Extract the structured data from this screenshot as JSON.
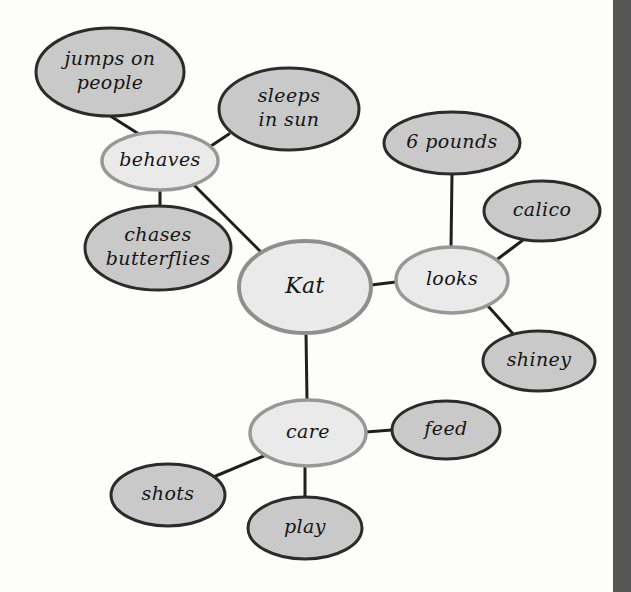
{
  "document": {
    "type": "concept-map",
    "title": "Kat",
    "background_color": "#fdfdfc",
    "right_strip_color": "#565656"
  },
  "style": {
    "primary_node_fill": "#eaeaea",
    "primary_node_stroke": "#8f8f8f",
    "leaf_node_fill": "#c9c9c9",
    "leaf_node_stroke": "#2b2b2b",
    "edge_color": "#1f1f1f",
    "text_color": "#151515"
  },
  "nodes": [
    {
      "id": "kat",
      "label": "Kat",
      "lines": [
        "Kat"
      ],
      "level": "root",
      "cx": 305,
      "cy": 287,
      "rx": 66,
      "ry": 46,
      "fill": "#eaeaea",
      "stroke": "#8f8f8f",
      "stroke_width": 4,
      "font_size": 22
    },
    {
      "id": "behaves",
      "label": "behaves",
      "lines": [
        "behaves"
      ],
      "level": "branch",
      "cx": 160,
      "cy": 161,
      "rx": 58,
      "ry": 29,
      "fill": "#eaeaea",
      "stroke": "#989898",
      "stroke_width": 3.5,
      "font_size": 19
    },
    {
      "id": "looks",
      "label": "looks",
      "lines": [
        "looks"
      ],
      "level": "branch",
      "cx": 452,
      "cy": 280,
      "rx": 56,
      "ry": 33,
      "fill": "#eaeaea",
      "stroke": "#989898",
      "stroke_width": 3.5,
      "font_size": 19
    },
    {
      "id": "care",
      "label": "care",
      "lines": [
        "care"
      ],
      "level": "branch",
      "cx": 308,
      "cy": 433,
      "rx": 58,
      "ry": 33,
      "fill": "#eaeaea",
      "stroke": "#989898",
      "stroke_width": 3.5,
      "font_size": 19
    },
    {
      "id": "jumps-on-people",
      "label": "jumps on people",
      "lines": [
        "jumps on",
        "people"
      ],
      "level": "leaf",
      "cx": 110,
      "cy": 72,
      "rx": 74,
      "ry": 44,
      "fill": "#c9c9c9",
      "stroke": "#2b2b2b",
      "stroke_width": 3,
      "font_size": 19
    },
    {
      "id": "sleeps-in-sun",
      "label": "sleeps in sun",
      "lines": [
        "sleeps",
        "in sun"
      ],
      "level": "leaf",
      "cx": 289,
      "cy": 109,
      "rx": 70,
      "ry": 41,
      "fill": "#c9c9c9",
      "stroke": "#2b2b2b",
      "stroke_width": 3,
      "font_size": 19
    },
    {
      "id": "chases-butterflies",
      "label": "chases butterflies",
      "lines": [
        "chases",
        "butterflies"
      ],
      "level": "leaf",
      "cx": 158,
      "cy": 248,
      "rx": 73,
      "ry": 42,
      "fill": "#c9c9c9",
      "stroke": "#2b2b2b",
      "stroke_width": 3,
      "font_size": 19
    },
    {
      "id": "six-pounds",
      "label": "6 pounds",
      "lines": [
        "6 pounds"
      ],
      "level": "leaf",
      "cx": 452,
      "cy": 143,
      "rx": 68,
      "ry": 31,
      "fill": "#c9c9c9",
      "stroke": "#2b2b2b",
      "stroke_width": 3,
      "font_size": 19
    },
    {
      "id": "calico",
      "label": "calico",
      "lines": [
        "calico"
      ],
      "level": "leaf",
      "cx": 542,
      "cy": 211,
      "rx": 58,
      "ry": 30,
      "fill": "#c9c9c9",
      "stroke": "#2b2b2b",
      "stroke_width": 3,
      "font_size": 19
    },
    {
      "id": "shiney",
      "label": "shiney",
      "lines": [
        "shiney"
      ],
      "level": "leaf",
      "cx": 539,
      "cy": 361,
      "rx": 56,
      "ry": 30,
      "fill": "#c9c9c9",
      "stroke": "#2b2b2b",
      "stroke_width": 3,
      "font_size": 19
    },
    {
      "id": "feed",
      "label": "feed",
      "lines": [
        "feed"
      ],
      "level": "leaf",
      "cx": 446,
      "cy": 430,
      "rx": 54,
      "ry": 29,
      "fill": "#c9c9c9",
      "stroke": "#2b2b2b",
      "stroke_width": 3,
      "font_size": 19
    },
    {
      "id": "shots",
      "label": "shots",
      "lines": [
        "shots"
      ],
      "level": "leaf",
      "cx": 168,
      "cy": 495,
      "rx": 57,
      "ry": 31,
      "fill": "#c9c9c9",
      "stroke": "#2b2b2b",
      "stroke_width": 3,
      "font_size": 19
    },
    {
      "id": "play",
      "label": "play",
      "lines": [
        "play"
      ],
      "level": "leaf",
      "cx": 305,
      "cy": 528,
      "rx": 57,
      "ry": 31,
      "fill": "#c9c9c9",
      "stroke": "#2b2b2b",
      "stroke_width": 3,
      "font_size": 19
    }
  ],
  "edges": [
    {
      "id": "edge-kat-behaves",
      "from": "kat",
      "to": "behaves",
      "x1": 262,
      "y1": 253,
      "x2": 192,
      "y2": 183,
      "width": 3
    },
    {
      "id": "edge-kat-looks",
      "from": "kat",
      "to": "looks",
      "x1": 371,
      "y1": 285,
      "x2": 396,
      "y2": 282,
      "width": 3
    },
    {
      "id": "edge-kat-care",
      "from": "kat",
      "to": "care",
      "x1": 306,
      "y1": 333,
      "x2": 307,
      "y2": 400,
      "width": 3
    },
    {
      "id": "edge-behaves-jumps",
      "from": "behaves",
      "to": "jumps-on-people",
      "x1": 142,
      "y1": 136,
      "x2": 104,
      "y2": 112,
      "width": 3
    },
    {
      "id": "edge-behaves-sleeps",
      "from": "behaves",
      "to": "sleeps-in-sun",
      "x1": 205,
      "y1": 150,
      "x2": 229,
      "y2": 134,
      "width": 3
    },
    {
      "id": "edge-behaves-chases",
      "from": "behaves",
      "to": "chases-butterflies",
      "x1": 160,
      "y1": 190,
      "x2": 160,
      "y2": 207,
      "width": 3
    },
    {
      "id": "edge-looks-pounds",
      "from": "looks",
      "to": "6 pounds",
      "x1": 451,
      "y1": 247,
      "x2": 452,
      "y2": 174,
      "width": 3
    },
    {
      "id": "edge-looks-calico",
      "from": "looks",
      "to": "calico",
      "x1": 495,
      "y1": 261,
      "x2": 523,
      "y2": 240,
      "width": 3
    },
    {
      "id": "edge-looks-shiney",
      "from": "looks",
      "to": "shiney",
      "x1": 488,
      "y1": 306,
      "x2": 514,
      "y2": 335,
      "width": 3
    },
    {
      "id": "edge-care-feed",
      "from": "care",
      "to": "feed",
      "x1": 366,
      "y1": 432,
      "x2": 392,
      "y2": 430,
      "width": 3
    },
    {
      "id": "edge-care-shots",
      "from": "care",
      "to": "shots",
      "x1": 266,
      "y1": 455,
      "x2": 211,
      "y2": 478,
      "width": 3
    },
    {
      "id": "edge-care-play",
      "from": "care",
      "to": "play",
      "x1": 305,
      "y1": 466,
      "x2": 305,
      "y2": 497,
      "width": 3
    }
  ]
}
